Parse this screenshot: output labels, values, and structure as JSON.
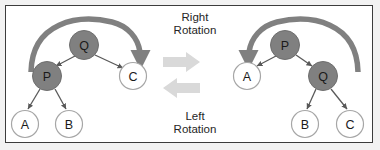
{
  "figure": {
    "title_center_top": "Right\nRotation",
    "title_center_bottom": "Left\nRotation",
    "center_labels": {
      "right_rotation_line1": "Right",
      "right_rotation_line2": "Rotation",
      "left_rotation_line1": "Left",
      "left_rotation_line2": "Rotation"
    },
    "colors": {
      "filled_node_fill": "#808080",
      "filled_node_stroke": "#6e6e6e",
      "open_node_fill": "#ffffff",
      "open_node_stroke": "#a6a6a6",
      "node_label": "#1a1a1a",
      "edge": "#595959",
      "curved_arrow": "#808080",
      "block_arrow": "#d9d9d9",
      "frame_border": "#3c3c3c",
      "page_background": "#f2f2f2",
      "panel_background": "#ffffff",
      "text": "#262626"
    },
    "left_tree": {
      "name": "before-right-rotation",
      "nodes": [
        {
          "id": "q-left",
          "label": "Q",
          "cx": 84,
          "cy": 45,
          "r": 14.5,
          "filled": true
        },
        {
          "id": "p-left",
          "label": "P",
          "cx": 47,
          "cy": 76,
          "r": 14.5,
          "filled": true
        },
        {
          "id": "c-left",
          "label": "C",
          "cx": 133,
          "cy": 76,
          "r": 13.5,
          "filled": false
        },
        {
          "id": "a-left",
          "label": "A",
          "cx": 25,
          "cy": 124,
          "r": 13.5,
          "filled": false
        },
        {
          "id": "b-left",
          "label": "B",
          "cx": 69,
          "cy": 124,
          "r": 13.5,
          "filled": false
        }
      ],
      "edges": [
        {
          "from": "q-left",
          "to": "p-left"
        },
        {
          "from": "q-left",
          "to": "c-left"
        },
        {
          "from": "p-left",
          "to": "a-left"
        },
        {
          "from": "p-left",
          "to": "b-left"
        }
      ],
      "curved_arrow": {
        "name": "right-rotation-curved-arrow",
        "direction": "clockwise-left-to-right",
        "start": [
          31,
          72
        ],
        "end": [
          141,
          66
        ]
      }
    },
    "right_tree": {
      "name": "after-right-rotation",
      "nodes": [
        {
          "id": "p-right",
          "label": "P",
          "cx": 285,
          "cy": 45,
          "r": 14.5,
          "filled": true
        },
        {
          "id": "a-right",
          "label": "A",
          "cx": 247,
          "cy": 76,
          "r": 13.5,
          "filled": false
        },
        {
          "id": "q-right",
          "label": "Q",
          "cx": 323,
          "cy": 76,
          "r": 14.5,
          "filled": true
        },
        {
          "id": "b-right",
          "label": "B",
          "cx": 305,
          "cy": 124,
          "r": 13.5,
          "filled": false
        },
        {
          "id": "c-right",
          "label": "C",
          "cx": 350,
          "cy": 124,
          "r": 13.5,
          "filled": false
        }
      ],
      "edges": [
        {
          "from": "p-right",
          "to": "a-right"
        },
        {
          "from": "p-right",
          "to": "q-right"
        },
        {
          "from": "q-right",
          "to": "b-right"
        },
        {
          "from": "q-right",
          "to": "c-right"
        }
      ],
      "curved_arrow": {
        "name": "left-rotation-curved-arrow",
        "direction": "counterclockwise-right-to-left",
        "start": [
          358,
          72
        ],
        "end": [
          240,
          66
        ]
      }
    },
    "center_arrows": [
      {
        "name": "right-arrow-block",
        "direction": "right",
        "y": 62
      },
      {
        "name": "left-arrow-block",
        "direction": "left",
        "y": 88
      }
    ]
  }
}
